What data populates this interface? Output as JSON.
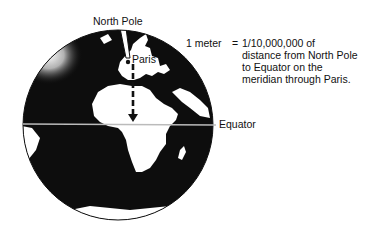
{
  "labels": {
    "north_pole": "North Pole",
    "paris": "Paris",
    "equator": "Equator"
  },
  "definition": {
    "lhs": "1 meter",
    "equals": "=",
    "lines": [
      "1/10,000,000 of",
      "distance from North Pole",
      "to Equator on the",
      "meridian through Paris."
    ]
  },
  "colors": {
    "ocean": "#0d0d0d",
    "land": "#ffffff",
    "outline": "#111111",
    "background": "#ffffff"
  }
}
